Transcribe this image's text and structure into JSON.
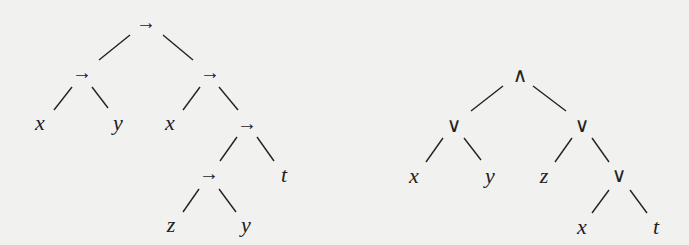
{
  "colors": {
    "background": "#f1f1ef",
    "ink": "#222222"
  },
  "trees": [
    {
      "name": "implication-tree",
      "nodes": [
        {
          "id": "a0",
          "label": "→",
          "kind": "op",
          "x": 146,
          "y": 22
        },
        {
          "id": "a1",
          "label": "→",
          "kind": "op",
          "x": 82,
          "y": 72
        },
        {
          "id": "a2",
          "label": "→",
          "kind": "op",
          "x": 210,
          "y": 72
        },
        {
          "id": "a3",
          "label": "x",
          "kind": "var",
          "x": 40,
          "y": 123
        },
        {
          "id": "a4",
          "label": "y",
          "kind": "var",
          "x": 118,
          "y": 123
        },
        {
          "id": "a5",
          "label": "x",
          "kind": "var",
          "x": 170,
          "y": 123
        },
        {
          "id": "a6",
          "label": "→",
          "kind": "op",
          "x": 247,
          "y": 123
        },
        {
          "id": "a7",
          "label": "→",
          "kind": "op",
          "x": 209,
          "y": 173
        },
        {
          "id": "a8",
          "label": "t",
          "kind": "var",
          "x": 284,
          "y": 175
        },
        {
          "id": "a9",
          "label": "z",
          "kind": "var",
          "x": 171,
          "y": 225
        },
        {
          "id": "a10",
          "label": "y",
          "kind": "var",
          "x": 246,
          "y": 225
        }
      ],
      "edges": [
        [
          130,
          35,
          99,
          60
        ],
        [
          163,
          35,
          193,
          60
        ],
        [
          72,
          87,
          54,
          110
        ],
        [
          92,
          87,
          108,
          108
        ],
        [
          200,
          87,
          183,
          110
        ],
        [
          219,
          87,
          238,
          110
        ],
        [
          237,
          137,
          220,
          161
        ],
        [
          257,
          137,
          274,
          161
        ],
        [
          199,
          189,
          183,
          212
        ],
        [
          219,
          189,
          236,
          212
        ]
      ]
    },
    {
      "name": "and-or-tree",
      "nodes": [
        {
          "id": "b0",
          "label": "∧",
          "kind": "op",
          "x": 520,
          "y": 75
        },
        {
          "id": "b1",
          "label": "∨",
          "kind": "op",
          "x": 454,
          "y": 125
        },
        {
          "id": "b2",
          "label": "∨",
          "kind": "op",
          "x": 582,
          "y": 125
        },
        {
          "id": "b3",
          "label": "x",
          "kind": "var",
          "x": 414,
          "y": 176
        },
        {
          "id": "b4",
          "label": "y",
          "kind": "var",
          "x": 490,
          "y": 176
        },
        {
          "id": "b5",
          "label": "z",
          "kind": "var",
          "x": 544,
          "y": 176
        },
        {
          "id": "b6",
          "label": "∨",
          "kind": "op",
          "x": 619,
          "y": 175
        },
        {
          "id": "b7",
          "label": "x",
          "kind": "var",
          "x": 582,
          "y": 227
        },
        {
          "id": "b8",
          "label": "t",
          "kind": "var",
          "x": 656,
          "y": 227
        }
      ],
      "edges": [
        [
          503,
          86,
          471,
          111
        ],
        [
          533,
          86,
          566,
          111
        ],
        [
          443,
          138,
          426,
          162
        ],
        [
          464,
          138,
          481,
          160
        ],
        [
          572,
          138,
          555,
          162
        ],
        [
          592,
          138,
          609,
          162
        ],
        [
          609,
          190,
          592,
          213
        ],
        [
          630,
          190,
          647,
          213
        ]
      ]
    }
  ]
}
